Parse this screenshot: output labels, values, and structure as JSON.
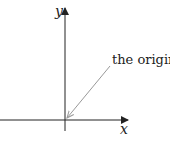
{
  "diagram": {
    "axes": {
      "x_label": "x",
      "y_label": "y"
    },
    "annotation": {
      "text": "the origin",
      "points_to": "origin"
    },
    "colors": {
      "axis": "#222222",
      "arrow": "#999999",
      "text": "#222222",
      "background": "#ffffff"
    }
  }
}
